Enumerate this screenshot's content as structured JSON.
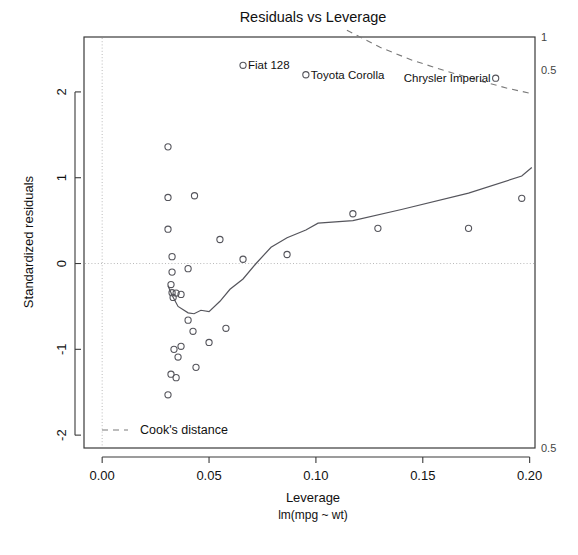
{
  "chart_data": {
    "type": "scatter",
    "title": "Residuals vs Leverage",
    "xlabel": "Leverage",
    "sublabel": "lm(mpg ~ wt)",
    "ylabel": "Standardized residuals",
    "xlim": [
      -0.0085,
      0.2025
    ],
    "ylim": [
      -2.15,
      2.64
    ],
    "xticks": [
      "0.00",
      "0.05",
      "0.10",
      "0.15",
      "0.20"
    ],
    "xtick_values": [
      0.0,
      0.05,
      0.1,
      0.15,
      0.2
    ],
    "yticks": [
      "2",
      "1",
      "0",
      "-1",
      "-2"
    ],
    "ytick_values": [
      2,
      1,
      0,
      -1,
      -2
    ],
    "grid": "dotted reference lines at x=0 and y=0",
    "legend_position": "bottom-left inside panel",
    "legend": [
      {
        "label": "Cook's distance",
        "style": "dashed-line"
      }
    ],
    "cook_contour_labels": [
      {
        "text": "1",
        "side": "right",
        "value": 1.0
      },
      {
        "text": "0.5",
        "side": "right",
        "value": 0.5
      },
      {
        "text": "0.5",
        "side": "right-bottom",
        "value": -0.5
      }
    ],
    "points": [
      {
        "leverage": 0.0308,
        "residual": 1.36,
        "label": ""
      },
      {
        "leverage": 0.0308,
        "residual": 0.77,
        "label": ""
      },
      {
        "leverage": 0.0432,
        "residual": 0.79,
        "label": ""
      },
      {
        "leverage": 0.0308,
        "residual": 0.4,
        "label": ""
      },
      {
        "leverage": 0.0551,
        "residual": 0.28,
        "label": ""
      },
      {
        "leverage": 0.0327,
        "residual": 0.08,
        "label": ""
      },
      {
        "leverage": 0.0659,
        "residual": 0.05,
        "label": ""
      },
      {
        "leverage": 0.0865,
        "residual": 0.105,
        "label": ""
      },
      {
        "leverage": 0.1173,
        "residual": 0.58,
        "label": ""
      },
      {
        "leverage": 0.129,
        "residual": 0.41,
        "label": ""
      },
      {
        "leverage": 0.1714,
        "residual": 0.41,
        "label": ""
      },
      {
        "leverage": 0.1963,
        "residual": 0.76,
        "label": ""
      },
      {
        "leverage": 0.0327,
        "residual": -0.1,
        "label": ""
      },
      {
        "leverage": 0.0402,
        "residual": -0.06,
        "label": ""
      },
      {
        "leverage": 0.0322,
        "residual": -0.245,
        "label": ""
      },
      {
        "leverage": 0.0327,
        "residual": -0.34,
        "label": ""
      },
      {
        "leverage": 0.0346,
        "residual": -0.345,
        "label": ""
      },
      {
        "leverage": 0.0369,
        "residual": -0.36,
        "label": ""
      },
      {
        "leverage": 0.0332,
        "residual": -0.395,
        "label": ""
      },
      {
        "leverage": 0.0402,
        "residual": -0.66,
        "label": ""
      },
      {
        "leverage": 0.0425,
        "residual": -0.79,
        "label": ""
      },
      {
        "leverage": 0.0579,
        "residual": -0.755,
        "label": ""
      },
      {
        "leverage": 0.05,
        "residual": -0.92,
        "label": ""
      },
      {
        "leverage": 0.0369,
        "residual": -0.965,
        "label": ""
      },
      {
        "leverage": 0.0336,
        "residual": -1.0,
        "label": ""
      },
      {
        "leverage": 0.0355,
        "residual": -1.09,
        "label": ""
      },
      {
        "leverage": 0.0439,
        "residual": -1.21,
        "label": ""
      },
      {
        "leverage": 0.0322,
        "residual": -1.29,
        "label": ""
      },
      {
        "leverage": 0.0346,
        "residual": -1.33,
        "label": ""
      },
      {
        "leverage": 0.0308,
        "residual": -1.53,
        "label": ""
      },
      {
        "leverage": 0.0659,
        "residual": 2.31,
        "label": "Fiat 128",
        "label_pos": "right"
      },
      {
        "leverage": 0.0953,
        "residual": 2.2,
        "label": "Toyota Corolla",
        "label_pos": "right"
      },
      {
        "leverage": 0.1841,
        "residual": 2.16,
        "label": "Chrysler Imperial",
        "label_pos": "left"
      }
    ],
    "loess_curve": [
      {
        "leverage": 0.0308,
        "residual": -0.26
      },
      {
        "leverage": 0.0327,
        "residual": -0.37
      },
      {
        "leverage": 0.0355,
        "residual": -0.5
      },
      {
        "leverage": 0.0402,
        "residual": -0.575
      },
      {
        "leverage": 0.043,
        "residual": -0.585
      },
      {
        "leverage": 0.0462,
        "residual": -0.545
      },
      {
        "leverage": 0.05,
        "residual": -0.56
      },
      {
        "leverage": 0.0551,
        "residual": -0.44
      },
      {
        "leverage": 0.0598,
        "residual": -0.3
      },
      {
        "leverage": 0.0659,
        "residual": -0.18
      },
      {
        "leverage": 0.072,
        "residual": 0.0
      },
      {
        "leverage": 0.079,
        "residual": 0.19
      },
      {
        "leverage": 0.0865,
        "residual": 0.3
      },
      {
        "leverage": 0.0953,
        "residual": 0.39
      },
      {
        "leverage": 0.101,
        "residual": 0.47
      },
      {
        "leverage": 0.1173,
        "residual": 0.5
      },
      {
        "leverage": 0.14,
        "residual": 0.63
      },
      {
        "leverage": 0.1714,
        "residual": 0.82
      },
      {
        "leverage": 0.1963,
        "residual": 1.02
      },
      {
        "leverage": 0.201,
        "residual": 1.12
      }
    ],
    "cook_curve_upper": [
      {
        "leverage": 0.1145,
        "residual": 2.72
      },
      {
        "leverage": 0.13,
        "residual": 2.52
      },
      {
        "leverage": 0.145,
        "residual": 2.37
      },
      {
        "leverage": 0.16,
        "residual": 2.25
      },
      {
        "leverage": 0.175,
        "residual": 2.14
      },
      {
        "leverage": 0.19,
        "residual": 2.04
      },
      {
        "leverage": 0.201,
        "residual": 1.98
      }
    ]
  }
}
